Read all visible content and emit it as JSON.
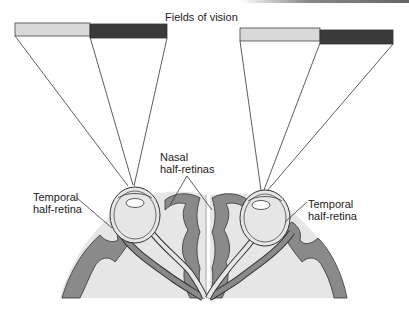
{
  "diagram": {
    "title": "Fields of vision",
    "labels": {
      "nasal_line1": "Nasal",
      "nasal_line2": "half-retinas",
      "temporal_left_line1": "Temporal",
      "temporal_left_line2": "half-retina",
      "temporal_right_line1": "Temporal",
      "temporal_right_line2": "half-retina"
    },
    "colors": {
      "field_light": "#d9d9d9",
      "field_dark": "#3a3a3a",
      "cortex_dark": "#8a8a8a",
      "cortex_light": "#e6e6e6",
      "line": "#333333"
    }
  }
}
